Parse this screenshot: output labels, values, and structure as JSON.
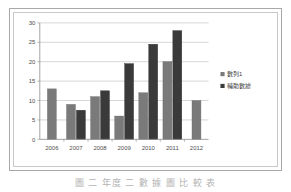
{
  "caption": "圖 二 年度 二 數 據 圖 比 較 表",
  "legend": {
    "position": "right",
    "entries": [
      {
        "label": "數列1",
        "color": "#7a7a7a",
        "marker": "square-marker"
      },
      {
        "label": "輔助數據",
        "color": "#3a3a3a",
        "marker": "square-marker"
      }
    ]
  },
  "chart_data": {
    "type": "bar",
    "title": "",
    "xlabel": "",
    "ylabel": "",
    "ylim": [
      0,
      30
    ],
    "yticks": [
      "0",
      "5",
      "10",
      "15",
      "20",
      "25",
      "30"
    ],
    "ytick_values": [
      0,
      5,
      10,
      15,
      20,
      25,
      30
    ],
    "grid": true,
    "categories": [
      "2006",
      "2007",
      "2008",
      "2009",
      "2010",
      "2011",
      "2012"
    ],
    "series": [
      {
        "name": "數列1",
        "color": "#7a7a7a",
        "values": [
          13,
          9,
          11,
          6,
          12,
          20,
          10
        ]
      },
      {
        "name": "輔助數據",
        "color": "#3a3a3a",
        "values": [
          null,
          7.5,
          12.5,
          19.5,
          24.5,
          28,
          null
        ]
      }
    ]
  }
}
